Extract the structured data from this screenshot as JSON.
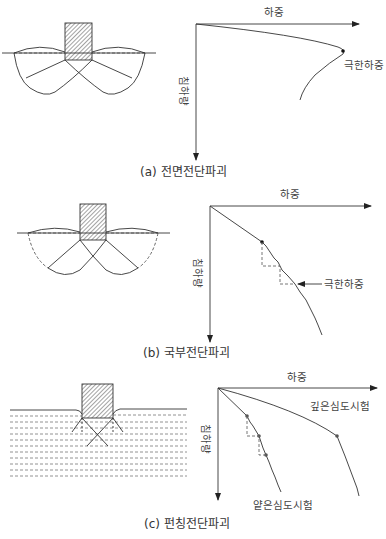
{
  "figure": {
    "panels": [
      {
        "id": "a",
        "caption": "(a)  전면전단파괴",
        "x_axis_label": "하중",
        "y_axis_label": "침하량",
        "annotation": "극한하중",
        "failure_mode": "general shear failure"
      },
      {
        "id": "b",
        "caption": "(b)  국부전단파괴",
        "x_axis_label": "하중",
        "y_axis_label": "침하량",
        "annotation": "극한하중",
        "failure_mode": "local shear failure"
      },
      {
        "id": "c",
        "caption": "(c)  펀칭전단파괴",
        "x_axis_label": "하중",
        "y_axis_label": "침하량",
        "curve_labels": [
          "깊은심도시험",
          "얕은심도시험"
        ],
        "failure_mode": "punching shear failure"
      }
    ],
    "colors": {
      "line": "#333333",
      "dashed": "#666666",
      "text": "#444444"
    }
  }
}
